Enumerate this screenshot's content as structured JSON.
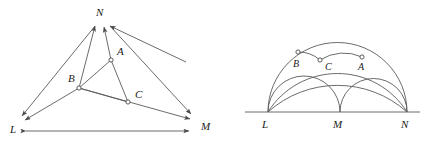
{
  "figure": {
    "title": "",
    "stroke_color": "#5a5a5a",
    "label_color": "#1a1a1a",
    "vertex_fill": "#ffffff",
    "panels": [
      {
        "id": "left-panel",
        "name": "triangle-with-cevian-arrows",
        "description": "Triangle LMN with interior points A, B, C joined by segments and double arrows to the vertices",
        "vertices": [
          {
            "label": "L",
            "x": 18,
            "y": 120,
            "lx": 12,
            "ly": 129
          },
          {
            "label": "M",
            "x": 196,
            "y": 118,
            "lx": 201,
            "ly": 128
          },
          {
            "label": "N",
            "x": 103,
            "y": 21,
            "lx": 96,
            "ly": 16
          }
        ],
        "interior_points": [
          {
            "label": "A",
            "x": 111,
            "y": 60,
            "lx": 118,
            "ly": 55
          },
          {
            "label": "B",
            "x": 79,
            "y": 88,
            "lx": 71,
            "ly": 81
          },
          {
            "label": "C",
            "x": 128,
            "y": 102,
            "lx": 136,
            "ly": 97
          }
        ],
        "segments": [
          {
            "name": "segment-A-B",
            "from": "A",
            "to": "B"
          },
          {
            "name": "segment-B-C",
            "from": "B",
            "to": "C"
          },
          {
            "name": "segment-C-A",
            "from": "C",
            "to": "A"
          }
        ],
        "arrows": [
          {
            "name": "arrow-B-to-N",
            "from": "B",
            "to": "N"
          },
          {
            "name": "arrow-A-to-N",
            "from": "A",
            "to": "N"
          },
          {
            "name": "arrow-C-to-N",
            "from": "C",
            "to": "N"
          },
          {
            "name": "arrow-A-to-L",
            "from": "A",
            "to": "L"
          },
          {
            "name": "arrow-B-to-L",
            "from": "B",
            "to": "L"
          },
          {
            "name": "arrow-A-to-M",
            "from": "A",
            "to": "M"
          },
          {
            "name": "arrow-C-to-M",
            "from": "C",
            "to": "M"
          }
        ],
        "base_line": {
          "name": "double-arrow-L-M",
          "x1": 24,
          "y1": 131,
          "x2": 193,
          "y2": 131,
          "double_headed": true
        }
      },
      {
        "id": "right-panel",
        "name": "arbelos-semicircles",
        "description": "Collinear points L, M, N on a baseline with semicircles on LM, MN and LN, plus arcs through interior points A, B, C",
        "baseline": {
          "x1": 245,
          "y1": 112,
          "x2": 420,
          "y2": 112
        },
        "vertices": [
          {
            "label": "L",
            "x": 268,
            "y": 112,
            "lx": 263,
            "ly": 125
          },
          {
            "label": "M",
            "x": 340,
            "y": 112,
            "lx": 334,
            "ly": 125
          },
          {
            "label": "N",
            "x": 407,
            "y": 112,
            "lx": 402,
            "ly": 125
          }
        ],
        "interior_points": [
          {
            "label": "A",
            "x": 362,
            "y": 57,
            "lx": 358,
            "ly": 70
          },
          {
            "label": "B",
            "x": 298,
            "y": 52,
            "lx": 295,
            "ly": 65
          },
          {
            "label": "C",
            "x": 320,
            "y": 60,
            "lx": 326,
            "ly": 69
          }
        ],
        "semicircles": [
          {
            "name": "semicircle-LM",
            "cx": 304,
            "cy": 112,
            "r": 36
          },
          {
            "name": "semicircle-MN",
            "cx": 373.5,
            "cy": 112,
            "r": 33.5
          },
          {
            "name": "semicircle-LN",
            "cx": 337.5,
            "cy": 112,
            "r": 69.5
          }
        ],
        "arcs": [
          {
            "name": "arc-L-to-N-through-B-A",
            "from": "L",
            "to": "N"
          },
          {
            "name": "arc-L-to-N-lower",
            "from": "L",
            "to": "N"
          },
          {
            "name": "arc-B-to-C",
            "from": "B",
            "to": "C"
          },
          {
            "name": "arc-C-to-A",
            "from": "C",
            "to": "A"
          },
          {
            "name": "arc-A-to-N",
            "from": "A",
            "to": "N"
          }
        ]
      }
    ]
  }
}
